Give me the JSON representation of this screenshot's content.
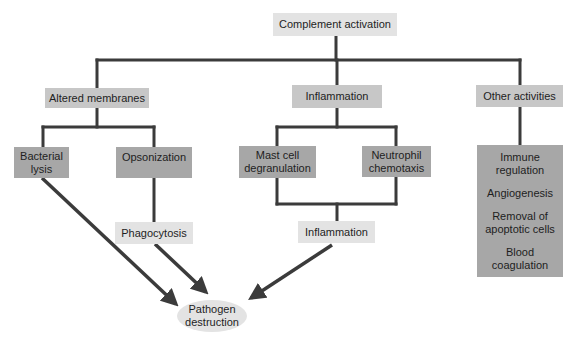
{
  "diagram": {
    "title": "Complement activation",
    "branches": {
      "altered_membranes": {
        "label": "Altered membranes",
        "children": {
          "bacterial_lysis": "Bacterial lysis",
          "opsonization": "Opsonization",
          "phagocytosis": "Phagocytosis"
        }
      },
      "inflammation": {
        "label": "Inflammation",
        "children": {
          "mast_cell": "Mast cell degranulation",
          "neutrophil": "Neutrophil chemotaxis",
          "result": "Inflammation"
        }
      },
      "other_activities": {
        "label": "Other activities",
        "items": [
          "Immune regulation",
          "Angiogenesis",
          "Removal of apoptotic cells",
          "Blood coagulation"
        ]
      }
    },
    "outcome": "Pathogen destruction"
  },
  "colors": {
    "light_box": "#e3e3e3",
    "medium_box": "#c7c7c7",
    "dark_box": "#a7a7a7",
    "connector": "#3b3b3b"
  }
}
